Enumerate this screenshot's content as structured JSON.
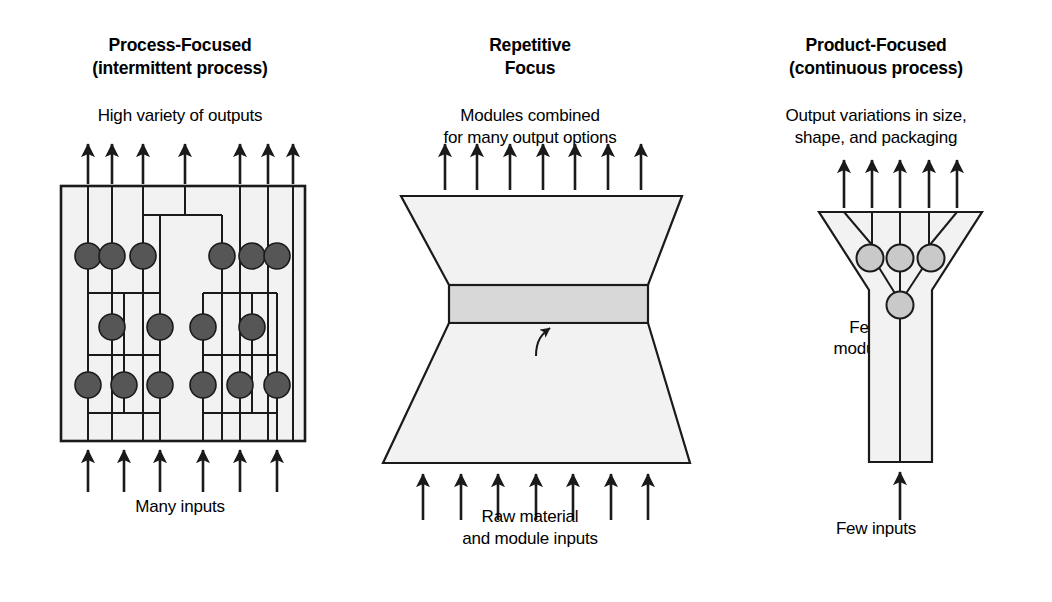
{
  "figure": {
    "background": "#ffffff",
    "line_color": "#1a1a1a",
    "panel_fill": "#f2f2f2",
    "dark_node_fill": "#565656",
    "light_node_fill": "#c9c9c9",
    "module_band_fill": "#d8d8d8"
  },
  "panels": [
    {
      "id": "process-focused",
      "title_line1": "Process-Focused",
      "title_line2": "(intermittent process)",
      "top_caption_line1": "High variety of outputs",
      "bottom_caption_line1": "Many inputs",
      "output_arrow_count": 7,
      "input_arrow_count": 6,
      "node_rows": [
        {
          "row": 1,
          "count": 6
        },
        {
          "row": 2,
          "count": 4
        },
        {
          "row": 3,
          "count": 6
        }
      ],
      "shape": "rectangle-with-routing-network"
    },
    {
      "id": "repetitive-focus",
      "title_line1": "Repetitive",
      "title_line2": "Focus",
      "top_caption_line1": "Modules combined",
      "top_caption_line2": "for many output options",
      "bottom_caption_line1": "Raw material",
      "bottom_caption_line2": "and module inputs",
      "annotation_line1": "Few",
      "annotation_line2": "modules",
      "output_arrow_count": 7,
      "input_arrow_count": 7,
      "shape": "hourglass-with-module-band"
    },
    {
      "id": "product-focused",
      "title_line1": "Product-Focused",
      "title_line2": "(continuous process)",
      "top_caption_line1": "Output variations in size,",
      "top_caption_line2": "shape, and packaging",
      "bottom_caption_line1": "Few inputs",
      "output_arrow_count": 5,
      "input_arrow_count": 1,
      "node_rows": [
        {
          "row": 1,
          "count": 3
        },
        {
          "row": 2,
          "count": 1
        }
      ],
      "shape": "funnel-into-column"
    }
  ]
}
